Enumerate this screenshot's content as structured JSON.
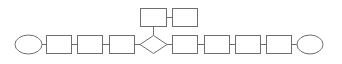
{
  "diagram": {
    "type": "flowchart",
    "stroke_color": "#6e6e6e",
    "fill_color": "#ffffff",
    "nodes": [
      {
        "id": "start",
        "shape": "ellipse",
        "label": ""
      },
      {
        "id": "step1",
        "shape": "rect",
        "label": ""
      },
      {
        "id": "step2",
        "shape": "rect",
        "label": ""
      },
      {
        "id": "step3",
        "shape": "rect",
        "label": ""
      },
      {
        "id": "decision",
        "shape": "diamond",
        "label": ""
      },
      {
        "id": "branch1",
        "shape": "rect",
        "label": ""
      },
      {
        "id": "branch2",
        "shape": "rect",
        "label": ""
      },
      {
        "id": "step4",
        "shape": "rect",
        "label": ""
      },
      {
        "id": "step5",
        "shape": "rect",
        "label": ""
      },
      {
        "id": "step6",
        "shape": "rect",
        "label": ""
      },
      {
        "id": "step7",
        "shape": "rect",
        "label": ""
      },
      {
        "id": "end",
        "shape": "ellipse",
        "label": ""
      }
    ],
    "edges": [
      [
        "start",
        "step1"
      ],
      [
        "step1",
        "step2"
      ],
      [
        "step2",
        "step3"
      ],
      [
        "step3",
        "decision"
      ],
      [
        "decision",
        "branch1"
      ],
      [
        "branch1",
        "branch2"
      ],
      [
        "decision",
        "step4"
      ],
      [
        "step4",
        "step5"
      ],
      [
        "step5",
        "step6"
      ],
      [
        "step6",
        "step7"
      ],
      [
        "step7",
        "end"
      ]
    ]
  }
}
